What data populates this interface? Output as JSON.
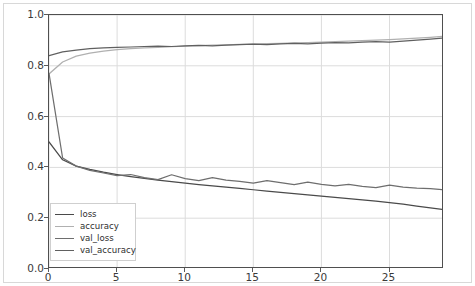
{
  "chart_data": {
    "type": "line",
    "title": "",
    "xlabel": "",
    "ylabel": "",
    "xlim": [
      0,
      29
    ],
    "ylim": [
      0.0,
      1.0
    ],
    "grid": true,
    "legend_position": "lower left",
    "xticks": [
      "0",
      "5",
      "10",
      "15",
      "20",
      "25"
    ],
    "xtick_values": [
      0,
      5,
      10,
      15,
      20,
      25
    ],
    "yticks": [
      "0.0",
      "0.2",
      "0.4",
      "0.6",
      "0.8",
      "1.0"
    ],
    "ytick_values": [
      0.0,
      0.2,
      0.4,
      0.6,
      0.8,
      1.0
    ],
    "x": [
      0,
      1,
      2,
      3,
      4,
      5,
      6,
      7,
      8,
      9,
      10,
      11,
      12,
      13,
      14,
      15,
      16,
      17,
      18,
      19,
      20,
      21,
      22,
      23,
      24,
      25,
      26,
      27,
      28,
      29
    ],
    "series": [
      {
        "name": "loss",
        "color": "#4a4a4a",
        "values": [
          0.5,
          0.43,
          0.405,
          0.392,
          0.381,
          0.372,
          0.364,
          0.357,
          0.35,
          0.344,
          0.338,
          0.332,
          0.327,
          0.322,
          0.317,
          0.312,
          0.307,
          0.302,
          0.297,
          0.292,
          0.287,
          0.282,
          0.277,
          0.272,
          0.267,
          0.261,
          0.255,
          0.248,
          0.241,
          0.234
        ]
      },
      {
        "name": "accuracy",
        "color": "#b0b0b0",
        "values": [
          0.768,
          0.815,
          0.838,
          0.85,
          0.858,
          0.864,
          0.868,
          0.871,
          0.873,
          0.875,
          0.877,
          0.879,
          0.881,
          0.882,
          0.884,
          0.885,
          0.887,
          0.888,
          0.89,
          0.891,
          0.893,
          0.895,
          0.897,
          0.899,
          0.901,
          0.903,
          0.906,
          0.909,
          0.912,
          0.916
        ]
      },
      {
        "name": "val_loss",
        "color": "#6e6e6e",
        "values": [
          0.77,
          0.437,
          0.405,
          0.388,
          0.378,
          0.368,
          0.372,
          0.36,
          0.352,
          0.371,
          0.356,
          0.348,
          0.36,
          0.35,
          0.345,
          0.338,
          0.348,
          0.34,
          0.332,
          0.342,
          0.333,
          0.327,
          0.333,
          0.325,
          0.32,
          0.33,
          0.322,
          0.318,
          0.316,
          0.312
        ]
      },
      {
        "name": "val_accuracy",
        "color": "#606060",
        "values": [
          0.84,
          0.855,
          0.862,
          0.868,
          0.871,
          0.873,
          0.874,
          0.876,
          0.877,
          0.876,
          0.878,
          0.88,
          0.878,
          0.881,
          0.883,
          0.885,
          0.883,
          0.886,
          0.888,
          0.886,
          0.889,
          0.891,
          0.89,
          0.893,
          0.895,
          0.893,
          0.897,
          0.901,
          0.905,
          0.91
        ]
      }
    ],
    "legend_entries": [
      {
        "label": "loss",
        "color": "#4a4a4a"
      },
      {
        "label": "accuracy",
        "color": "#b0b0b0"
      },
      {
        "label": "val_loss",
        "color": "#6e6e6e"
      },
      {
        "label": "val_accuracy",
        "color": "#606060"
      }
    ],
    "style": {
      "grid_color": "#dcdcdc",
      "axes_edge_color": "#4f4f4f",
      "tick_label_color": "#3a3a3a",
      "background": "#ffffff"
    }
  }
}
